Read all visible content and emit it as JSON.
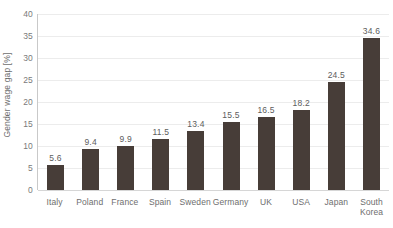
{
  "chart_data": {
    "type": "bar",
    "title": "",
    "xlabel": "",
    "ylabel": "Gender wage gap [%]",
    "ylim": [
      0,
      40
    ],
    "yticks": [
      0,
      5,
      10,
      15,
      20,
      25,
      30,
      35,
      40
    ],
    "ytick_labels": [
      "0",
      "5",
      "10",
      "15",
      "20",
      "25",
      "30",
      "35",
      "40"
    ],
    "grid": true,
    "legend": false,
    "legend_position": "none",
    "bar_color": "#473d38",
    "gridline_color": "#ececec",
    "axis_color": "#c9c9c9",
    "categories": [
      "Italy",
      "Poland",
      "France",
      "Spain",
      "Sweden",
      "Germany",
      "UK",
      "USA",
      "Japan",
      "South\nKorea"
    ],
    "values": [
      5.6,
      9.4,
      9.9,
      11.5,
      13.4,
      15.5,
      16.5,
      18.2,
      24.5,
      34.6
    ],
    "data_labels": [
      "5.6",
      "9.4",
      "9.9",
      "11.5",
      "13.4",
      "15.5",
      "16.5",
      "18.2",
      "24.5",
      "34.6"
    ]
  }
}
